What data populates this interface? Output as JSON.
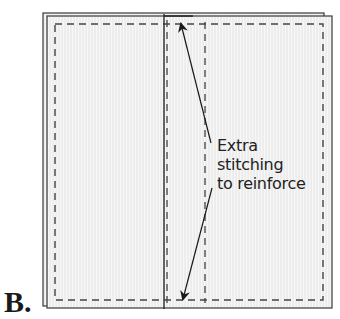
{
  "figure": {
    "label": "B.",
    "callout": {
      "lines": [
        "Extra",
        "stitching",
        "to reinforce"
      ]
    },
    "colors": {
      "fabric_fill": "#ececec",
      "fabric_stripe": "#f6f6f6",
      "outline": "#3a3a3a",
      "seam": "#444444",
      "arrow": "#1a1a1a",
      "background": "#ffffff"
    },
    "elements": [
      "back-fabric-sheet",
      "front-fabric-sheet",
      "seam-allowance-dashed-rectangle",
      "center-fold-line",
      "reinforcement-stitching-lines",
      "double-headed-arrow"
    ]
  }
}
